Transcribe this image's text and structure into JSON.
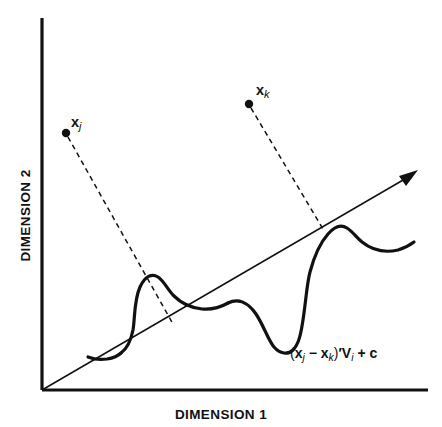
{
  "figure": {
    "type": "diagram",
    "background_color": "#ffffff",
    "ink_color": "#111111"
  },
  "axes": {
    "x_label": "DIMENSION 1",
    "y_label": "DIMENSION 2",
    "origin": [
      42,
      390
    ],
    "x_axis_end": [
      428,
      390
    ],
    "y_axis_end": [
      42,
      18
    ]
  },
  "projection_axis": {
    "name": "discriminant-direction-arrow",
    "start": [
      42,
      390
    ],
    "end": [
      416,
      172
    ],
    "has_arrowhead": true
  },
  "points": [
    {
      "id": "xj",
      "label_main": "x",
      "label_sub": "j",
      "dot": [
        66,
        133
      ],
      "projection_foot": [
        171,
        321
      ]
    },
    {
      "id": "xk",
      "label_main": "x",
      "label_sub": "k",
      "dot": [
        249,
        104
      ],
      "projection_foot": [
        321,
        226
      ]
    }
  ],
  "formula": {
    "full_text": "(xj − xk)'Vi + c",
    "open_paren": "(",
    "x_first": "x",
    "sub_j": "j",
    "minus": " − ",
    "x_second": "x",
    "sub_k": "k",
    "close_paren": ")",
    "prime": "′",
    "v": "V",
    "sub_i": "i",
    "plus": " + ",
    "c": "c"
  },
  "curves": [
    {
      "name": "density-curve-left",
      "description": "steep-rising hump peaking above the diagonal near the xj projection, descending into a trough"
    },
    {
      "name": "density-curve-right",
      "description": "hump peaking above the diagonal near the xk projection with a deep trough below the line"
    }
  ]
}
